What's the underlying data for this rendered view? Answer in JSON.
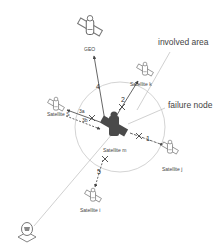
{
  "colors": {
    "line": "#555555",
    "failure_node": "#4a4a4a",
    "circle": "#c8c8c8",
    "callout_line": "#bbbbbb",
    "satellite_outline": "#666666"
  },
  "callouts": {
    "involved_area": "involved area",
    "failure_node": "failure node"
  },
  "nodes": {
    "geo": {
      "label": "GEO",
      "icon": "satellite-icon"
    },
    "satellite_k": {
      "label": "Satellite k",
      "icon": "satellite-icon"
    },
    "satellite_s": {
      "label": "Satellite S",
      "icon": "satellite-icon"
    },
    "satellite_m": {
      "label": "Satellite m",
      "icon": "satellite-icon",
      "state": "failure"
    },
    "satellite_j": {
      "label": "Satellite j",
      "icon": "satellite-icon"
    },
    "satellite_i": {
      "label": "Satellite i",
      "icon": "satellite-icon"
    },
    "ground_station": {
      "label": "",
      "icon": "ground-station-icon"
    }
  },
  "links": [
    {
      "id": "1",
      "label": "1",
      "from": "satellite_m",
      "to": "satellite_j",
      "style": "solid",
      "broken": true
    },
    {
      "id": "2",
      "label": "2",
      "from": "satellite_m",
      "to": "satellite_k",
      "style": "solid",
      "broken": true
    },
    {
      "id": "3a",
      "label": "3a",
      "from": "satellite_m",
      "to": "satellite_s",
      "style": "solid",
      "broken": true
    },
    {
      "id": "3b",
      "label": "3b",
      "from": "satellite_s",
      "to": "satellite_m",
      "style": "dashed",
      "broken": false
    },
    {
      "id": "4",
      "label": "4",
      "from": "satellite_m",
      "to": "satellite_i",
      "style": "dashed",
      "broken": true
    },
    {
      "id": "5",
      "label": "5",
      "from": "satellite_m",
      "to": "geo",
      "style": "solid",
      "broken": false
    },
    {
      "id": "ground",
      "label": "",
      "from": "ground_station",
      "to": "satellite_m",
      "style": "thin",
      "broken": false
    }
  ]
}
